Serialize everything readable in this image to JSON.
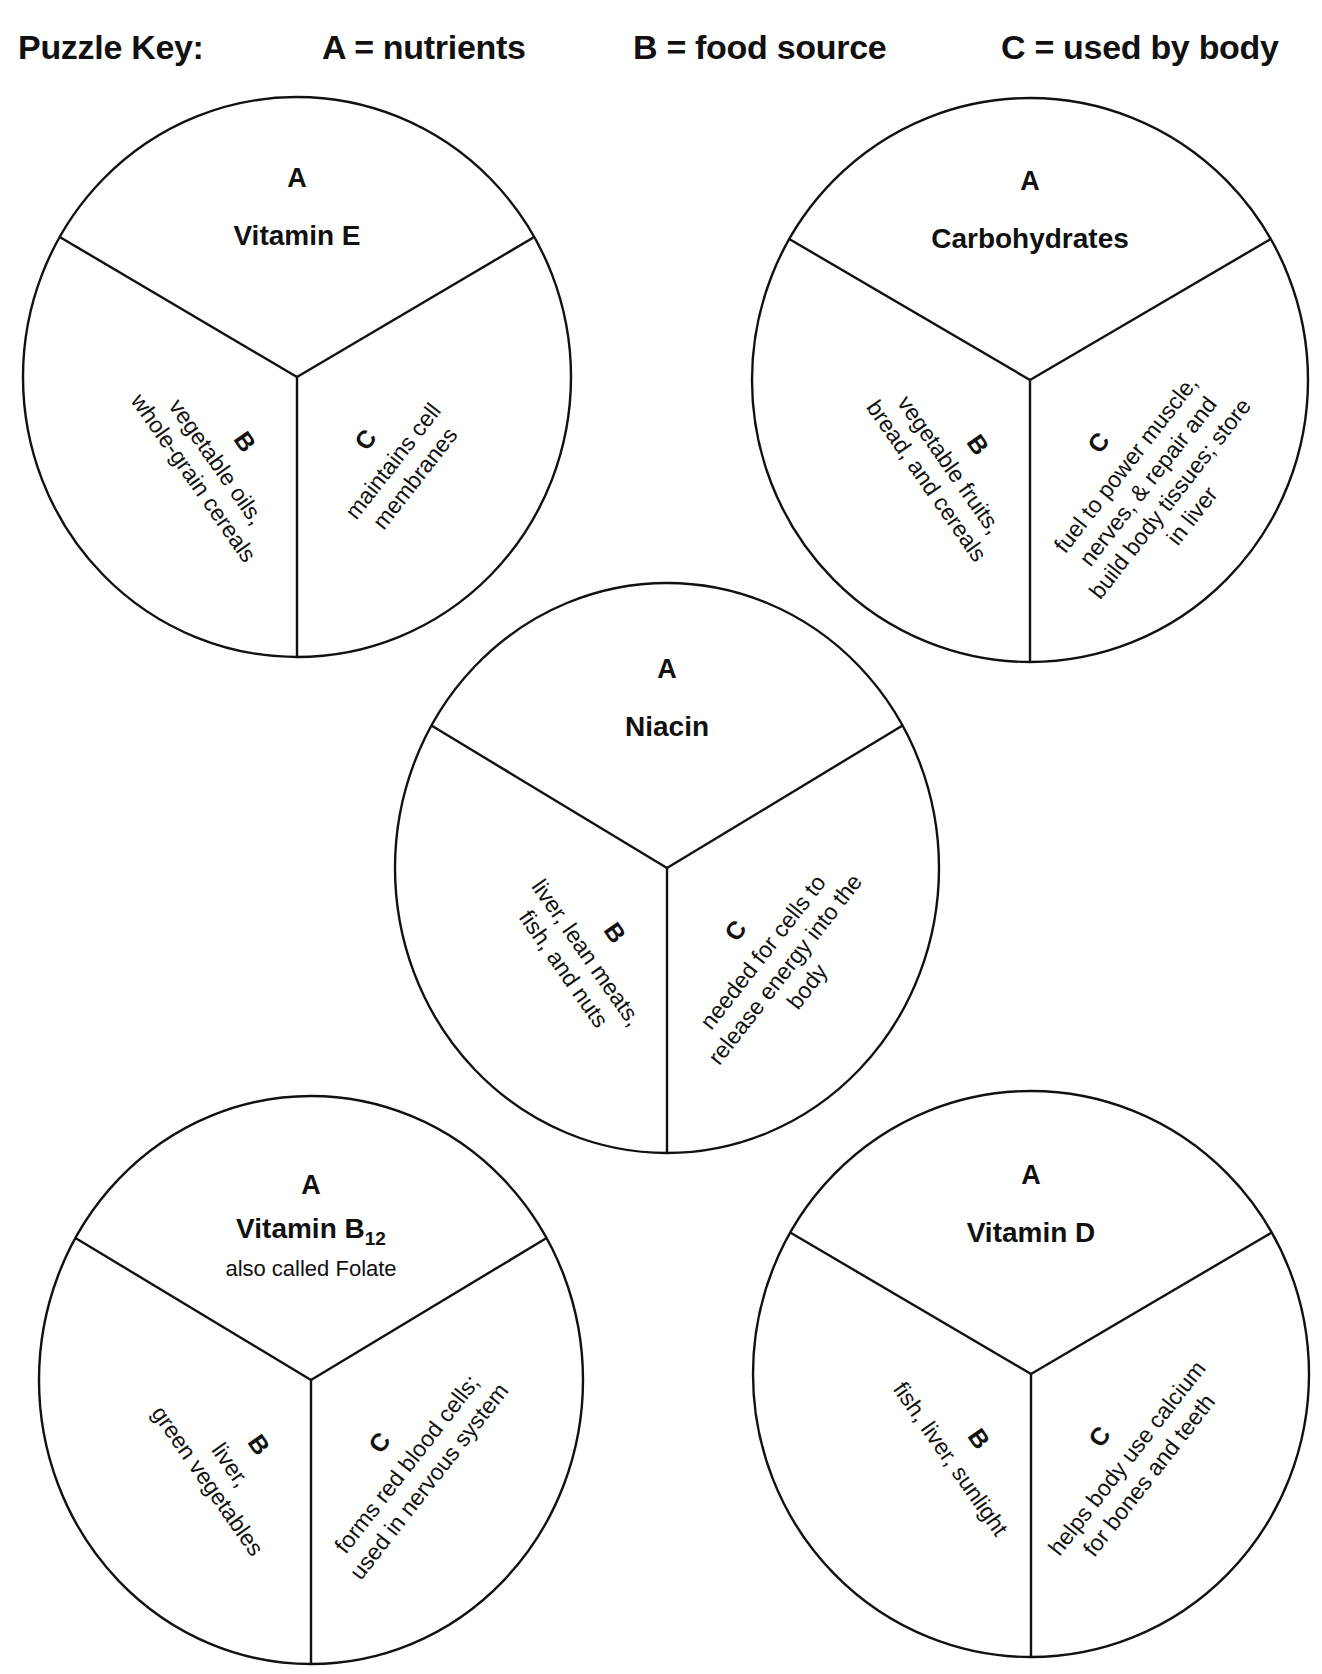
{
  "key": {
    "title": "Puzzle Key:",
    "a": "A = nutrients",
    "b": "B = food source",
    "c": "C = used by body"
  },
  "circles": [
    {
      "id": "vitamin-e",
      "cx": 297,
      "cy": 377,
      "rx": 274,
      "ry": 280,
      "a_label": "A",
      "nutrient": "Vitamin E",
      "nutrient_sub": "",
      "note": "",
      "b_label": "B",
      "b_lines": [
        "vegetable oils,",
        "whole-grain cereals"
      ],
      "c_label": "C",
      "c_lines": [
        "maintains cell",
        "membranes"
      ]
    },
    {
      "id": "carbohydrates",
      "cx": 1030,
      "cy": 380,
      "rx": 278,
      "ry": 282,
      "a_label": "A",
      "nutrient": "Carbohydrates",
      "nutrient_sub": "",
      "note": "",
      "b_label": "B",
      "b_lines": [
        "vegetable fruits,",
        "bread, and cereals"
      ],
      "c_label": "C",
      "c_lines": [
        "fuel to power muscle,",
        "nerves, & repair and",
        "build body tissues; store",
        "in liver"
      ]
    },
    {
      "id": "niacin",
      "cx": 667,
      "cy": 868,
      "rx": 272,
      "ry": 285,
      "a_label": "A",
      "nutrient": "Niacin",
      "nutrient_sub": "",
      "note": "",
      "b_label": "B",
      "b_lines": [
        "liver, lean meats,",
        "fish, and nuts"
      ],
      "c_label": "C",
      "c_lines": [
        "needed for cells to",
        "release energy into the",
        "body"
      ]
    },
    {
      "id": "vitamin-b12",
      "cx": 311,
      "cy": 1380,
      "rx": 272,
      "ry": 284,
      "a_label": "A",
      "nutrient": "Vitamin B",
      "nutrient_sub": "12",
      "note": "also called Folate",
      "b_label": "B",
      "b_lines": [
        "liver,",
        "green vegetables"
      ],
      "c_label": "C",
      "c_lines": [
        "forms red blood cells;",
        "used in nervous system"
      ]
    },
    {
      "id": "vitamin-d",
      "cx": 1031,
      "cy": 1374,
      "rx": 278,
      "ry": 283,
      "a_label": "A",
      "nutrient": "Vitamin D",
      "nutrient_sub": "",
      "note": "",
      "b_label": "B",
      "b_lines": [
        "fish, liver, sunlight"
      ],
      "c_label": "C",
      "c_lines": [
        "helps body use calcium",
        "for bones and teeth"
      ]
    }
  ]
}
